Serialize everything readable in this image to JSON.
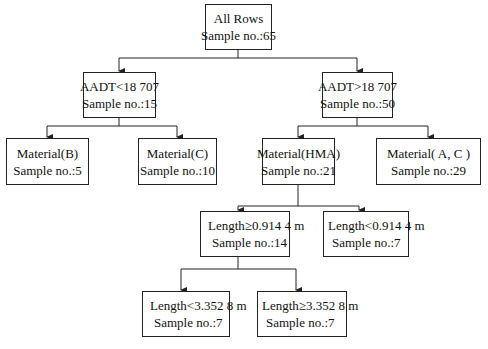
{
  "diagram": {
    "type": "decision-tree",
    "root": {
      "label": "All Rows",
      "sample": "Sample no.:65"
    },
    "level1": [
      {
        "label": "AADT<18 707",
        "sample": "Sample no.:15"
      },
      {
        "label": "AADT>18 707",
        "sample": "Sample no.:50"
      }
    ],
    "level2": [
      {
        "label": "Material(B)",
        "sample": "Sample no.:5"
      },
      {
        "label": "Material(C)",
        "sample": "Sample no.:10"
      },
      {
        "label": "Material(HMA)",
        "sample": "Sample no.:21"
      },
      {
        "label": "Material( A, C )",
        "sample": "Sample no.:29"
      }
    ],
    "level3": [
      {
        "label": "Length≥0.914 4 m",
        "sample": "Sample no.:14"
      },
      {
        "label": "Length<0.914 4 m",
        "sample": "Sample no.:7"
      }
    ],
    "level4": [
      {
        "label": "Length<3.352 8 m",
        "sample": "Sample no.:7"
      },
      {
        "label": "Length≥3.352 8 m",
        "sample": "Sample no.:7"
      }
    ],
    "line_color": "#222222",
    "background": "#ffffff"
  }
}
